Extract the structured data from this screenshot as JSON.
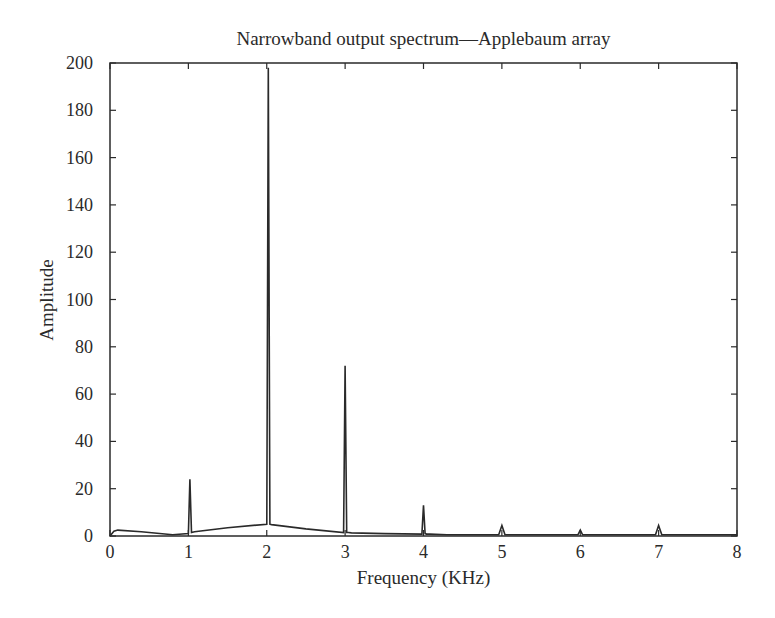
{
  "chart_data": {
    "type": "line",
    "title": "Narrowband output spectrum—Applebaum array",
    "xlabel": "Frequency (KHz)",
    "ylabel": "Amplitude",
    "xlim": [
      0,
      8
    ],
    "ylim": [
      0,
      200
    ],
    "grid": false,
    "legend": null,
    "x_ticks": [
      "0",
      "1",
      "2",
      "3",
      "4",
      "5",
      "6",
      "7",
      "8"
    ],
    "y_ticks": [
      "0",
      "20",
      "40",
      "60",
      "80",
      "100",
      "120",
      "140",
      "160",
      "180",
      "200"
    ],
    "series": [
      {
        "name": "Output spectrum",
        "color": "#2a2a2a",
        "x": [
          0.0,
          0.05,
          0.1,
          0.4,
          0.8,
          1.0,
          1.02,
          1.04,
          1.08,
          1.5,
          2.0,
          2.02,
          2.04,
          2.06,
          2.5,
          2.98,
          3.0,
          3.02,
          3.04,
          3.08,
          3.5,
          3.98,
          4.0,
          4.02,
          4.04,
          4.08,
          4.3,
          4.5,
          4.96,
          5.0,
          5.04,
          5.5,
          5.97,
          6.0,
          6.03,
          6.5,
          6.96,
          7.0,
          7.04,
          7.5,
          8.0
        ],
        "y": [
          0.0,
          2.0,
          2.5,
          1.8,
          0.5,
          1.0,
          24.0,
          1.5,
          1.8,
          3.5,
          5.0,
          198.0,
          5.0,
          4.8,
          3.0,
          1.5,
          72.0,
          1.5,
          1.5,
          1.3,
          1.0,
          0.8,
          13.0,
          1.0,
          0.8,
          0.8,
          0.5,
          0.5,
          0.5,
          4.5,
          0.5,
          0.5,
          0.5,
          2.5,
          0.5,
          0.5,
          0.5,
          4.5,
          0.5,
          0.5,
          0.5
        ]
      }
    ],
    "peaks": [
      {
        "frequency_khz": 1,
        "amplitude": 24
      },
      {
        "frequency_khz": 2,
        "amplitude": 198
      },
      {
        "frequency_khz": 3,
        "amplitude": 72
      },
      {
        "frequency_khz": 4,
        "amplitude": 13
      },
      {
        "frequency_khz": 5,
        "amplitude": 4.5
      },
      {
        "frequency_khz": 6,
        "amplitude": 2.5
      },
      {
        "frequency_khz": 7,
        "amplitude": 4.5
      }
    ]
  }
}
